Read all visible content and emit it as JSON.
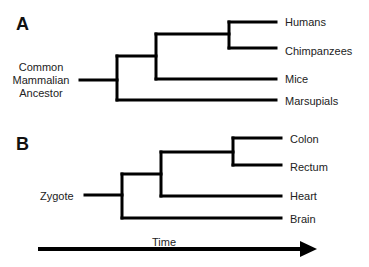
{
  "panels": {
    "a": {
      "label": "A",
      "root": {
        "lines": [
          "Common",
          "Mammalian",
          "Ancestor"
        ]
      },
      "leaves": [
        "Humans",
        "Chimpanzees",
        "Mice",
        "Marsupials"
      ],
      "topology": "((((Humans,Chimpanzees),Mice),Marsupials)Common Mammalian Ancestor)"
    },
    "b": {
      "label": "B",
      "root": {
        "lines": [
          "Zygote"
        ]
      },
      "leaves": [
        "Colon",
        "Rectum",
        "Heart",
        "Brain"
      ],
      "topology": "((((Colon,Rectum),Heart),Brain)Zygote)"
    }
  },
  "axis": {
    "label": "Time",
    "direction": "left-to-right"
  },
  "colors": {
    "line": "#000000",
    "text": "#222222",
    "background": "#ffffff"
  }
}
